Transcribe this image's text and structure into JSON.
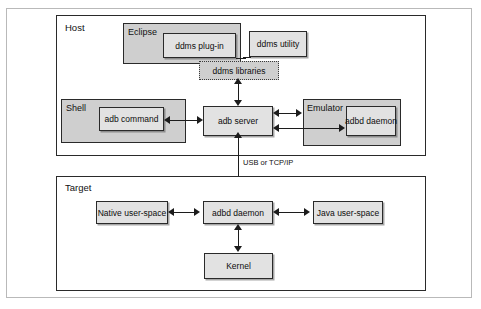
{
  "diagram": {
    "colors": {
      "container_fill": "#ffffff",
      "group_fill": "#cfcfcf",
      "node_fill": "#e2e2e2",
      "border": "#2a2a2a",
      "line": "#1c1c1c",
      "page_frame": "#b9b9b9"
    },
    "containers": [
      {
        "id": "host",
        "label": "Host"
      },
      {
        "id": "target",
        "label": "Target"
      }
    ],
    "groups": [
      {
        "id": "eclipse",
        "label": "Eclipse"
      },
      {
        "id": "shell",
        "label": "Shell"
      },
      {
        "id": "emulator",
        "label": "Emulator"
      }
    ],
    "nodes": [
      {
        "id": "ddms-plugin",
        "label": "ddms plug-in"
      },
      {
        "id": "ddms-utility",
        "label": "ddms utility"
      },
      {
        "id": "ddms-libraries",
        "label": "ddms libraries"
      },
      {
        "id": "adb-command",
        "label": "adb command"
      },
      {
        "id": "adb-server",
        "label": "adb server"
      },
      {
        "id": "emulator-adbd-daemon",
        "label": "adbd daemon"
      },
      {
        "id": "native-user-space",
        "label": "Native user-space"
      },
      {
        "id": "target-adbd-daemon",
        "label": "adbd daemon"
      },
      {
        "id": "java-user-space",
        "label": "Java user-space"
      },
      {
        "id": "kernel",
        "label": "Kernel"
      }
    ],
    "edge_labels": [
      {
        "id": "host-target-link",
        "label": "USB or TCP/IP"
      }
    ]
  }
}
